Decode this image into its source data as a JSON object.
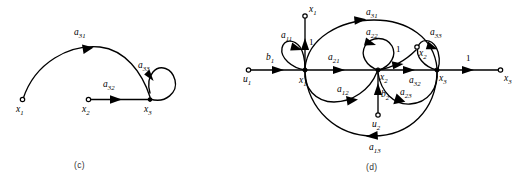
{
  "figure": {
    "panels": [
      {
        "id": "c",
        "caption": "(c)",
        "nodes": [
          {
            "name": "x1",
            "base": "x",
            "sub": "1"
          },
          {
            "name": "x2",
            "base": "x",
            "sub": "2"
          },
          {
            "name": "x3",
            "base": "x",
            "sub": "3"
          }
        ],
        "edges": [
          {
            "name": "a31",
            "base": "a",
            "sub": "31",
            "from": "x1",
            "to": "x3",
            "kind": "arc"
          },
          {
            "name": "a32",
            "base": "a",
            "sub": "32",
            "from": "x2",
            "to": "x3",
            "kind": "straight"
          },
          {
            "name": "a33",
            "base": "a",
            "sub": "33",
            "from": "x3",
            "to": "x3",
            "kind": "self-loop"
          }
        ]
      },
      {
        "id": "d",
        "caption": "(d)",
        "nodes": [
          {
            "name": "u1",
            "base": "u",
            "sub": "1"
          },
          {
            "name": "u2",
            "base": "u",
            "sub": "2"
          },
          {
            "name": "x1",
            "base": "x",
            "sub": "1"
          },
          {
            "name": "x2",
            "base": "x",
            "sub": "2"
          },
          {
            "name": "x3",
            "base": "x",
            "sub": "3"
          },
          {
            "name": "x1_out",
            "base": "x",
            "sub": "1"
          },
          {
            "name": "x2_out",
            "base": "x",
            "sub": "2"
          },
          {
            "name": "x3_out",
            "base": "x",
            "sub": "3"
          }
        ],
        "edges": [
          {
            "name": "b1",
            "base": "b",
            "sub": "1",
            "from": "u1",
            "to": "x1",
            "kind": "straight"
          },
          {
            "name": "b2",
            "base": "b",
            "sub": "2",
            "from": "u2",
            "to": "x2",
            "kind": "straight"
          },
          {
            "name": "a11",
            "base": "a",
            "sub": "11",
            "from": "x1",
            "to": "x1",
            "kind": "self-loop"
          },
          {
            "name": "a22",
            "base": "a",
            "sub": "22",
            "from": "x2",
            "to": "x2",
            "kind": "self-loop"
          },
          {
            "name": "a33",
            "base": "a",
            "sub": "33",
            "from": "x3",
            "to": "x3",
            "kind": "self-loop"
          },
          {
            "name": "a21",
            "base": "a",
            "sub": "21",
            "from": "x1",
            "to": "x2",
            "kind": "straight"
          },
          {
            "name": "a12",
            "base": "a",
            "sub": "12",
            "from": "x1",
            "to": "x2",
            "kind": "arc"
          },
          {
            "name": "a31",
            "base": "a",
            "sub": "31",
            "from": "x1",
            "to": "x3",
            "kind": "arc"
          },
          {
            "name": "a13",
            "base": "a",
            "sub": "13",
            "from": "x3",
            "to": "x1",
            "kind": "arc"
          },
          {
            "name": "a32",
            "base": "a",
            "sub": "32",
            "from": "x2",
            "to": "x3",
            "kind": "straight"
          },
          {
            "name": "a23",
            "base": "a",
            "sub": "23",
            "from": "x3",
            "to": "x2",
            "kind": "arc"
          }
        ],
        "unit_gains": [
          {
            "name": "gain-x1-out",
            "value": "1",
            "from": "x1",
            "to": "x1_out"
          },
          {
            "name": "gain-x2-out",
            "value": "1",
            "from": "x2",
            "to": "x2_out"
          },
          {
            "name": "gain-x3-out",
            "value": "1",
            "from": "x3",
            "to": "x3_out"
          }
        ]
      }
    ]
  }
}
